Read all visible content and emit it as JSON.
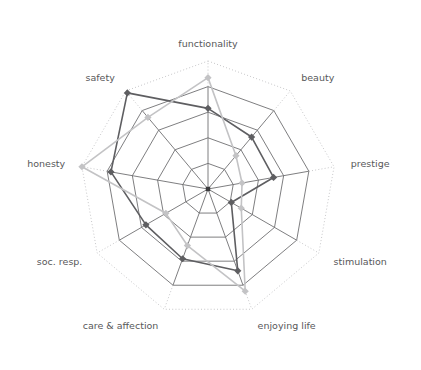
{
  "chart_data": {
    "type": "radar",
    "title": "",
    "subtitle": "",
    "xlabel": "",
    "ylabel": "",
    "grid": true,
    "legend": "none",
    "rings": 5,
    "ring_style": [
      "solid",
      "solid",
      "solid",
      "solid",
      "dotted"
    ],
    "rmin": 0,
    "rmax": 1,
    "start_angle_deg": -90,
    "categories": [
      "functionality",
      "beauty",
      "prestige",
      "stimulation",
      "enjoying life",
      "care & affection",
      "soc. resp.",
      "honesty",
      "safety"
    ],
    "series": [
      {
        "name": "series-dark",
        "color": "#5e5e61",
        "marker_color": "#5e5e61",
        "line_width": 1.6,
        "values": [
          0.63,
          0.53,
          0.52,
          0.21,
          0.68,
          0.58,
          0.56,
          0.77,
          0.98
        ]
      },
      {
        "name": "series-light",
        "color": "#c3c3c5",
        "marker_color": "#c3c3c5",
        "line_width": 1.6,
        "values": [
          0.87,
          0.34,
          0.27,
          0.3,
          0.85,
          0.47,
          0.38,
          1.0,
          0.73
        ]
      }
    ],
    "colors": {
      "background": "#ffffff",
      "grid_solid": "#6f6f72",
      "grid_dotted": "#b9b9bb",
      "label_text": "#58585a",
      "series_dark": "#5e5e61",
      "series_light": "#c3c3c5"
    },
    "labels": {
      "functionality": "functionality",
      "beauty": "beauty",
      "prestige": "prestige",
      "stimulation": "stimulation",
      "enjoying_life": "enjoying life",
      "care_affection": "care & affection",
      "soc_resp": "soc. resp.",
      "honesty": "honesty",
      "safety": "safety"
    },
    "geometry": {
      "cx": 208,
      "cy": 189,
      "radius": 128,
      "label_offset": 17
    }
  }
}
